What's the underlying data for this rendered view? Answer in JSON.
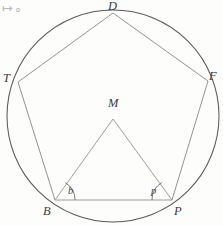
{
  "figure": {
    "corner_mark": "↦∘",
    "colors": {
      "circle_stroke": "#5a5a5a",
      "pentagon_stroke": "#8a8a8a",
      "triangle_stroke": "#9a9a9a",
      "chord_stroke": "#9b9b9b",
      "arc_stroke": "#6b6b6b",
      "label_color": "#3b3b3b",
      "background": "#fdfdfc"
    },
    "circle": {
      "cx": 113,
      "cy": 116,
      "r": 106
    },
    "vertices": [
      {
        "id": "D",
        "label": "D",
        "x": 113,
        "y": 13,
        "label_x": 110,
        "label_y": 0
      },
      {
        "id": "T",
        "label": "T",
        "x": 18,
        "y": 82,
        "label_x": 3,
        "label_y": 72
      },
      {
        "id": "F",
        "label": "F",
        "x": 208,
        "y": 81,
        "label_x": 210,
        "label_y": 71
      },
      {
        "id": "B",
        "label": "B",
        "x": 55,
        "y": 200,
        "label_x": 43,
        "label_y": 205
      },
      {
        "id": "P",
        "label": "P",
        "x": 172,
        "y": 200,
        "label_x": 174,
        "label_y": 205
      }
    ],
    "center_point": {
      "id": "M",
      "label": "M",
      "x": 113,
      "y": 119,
      "label_x": 108,
      "label_y": 98
    },
    "angles": [
      {
        "id": "b",
        "label": "b",
        "at_vertex": "B",
        "label_x": 68,
        "label_y": 186
      },
      {
        "id": "p",
        "label": "p",
        "at_vertex": "P",
        "label_x": 151,
        "label_y": 186
      }
    ],
    "segments": [
      {
        "name": "pentagon-side-D-T",
        "from": "D",
        "to": "T"
      },
      {
        "name": "pentagon-side-D-F",
        "from": "D",
        "to": "F"
      },
      {
        "name": "pentagon-side-T-B",
        "from": "T",
        "to": "B"
      },
      {
        "name": "pentagon-side-F-P",
        "from": "F",
        "to": "P"
      },
      {
        "name": "pentagon-side-B-P",
        "from": "B",
        "to": "P"
      },
      {
        "name": "radius-M-B",
        "from": "M",
        "to": "B"
      },
      {
        "name": "radius-M-P",
        "from": "M",
        "to": "P"
      }
    ]
  }
}
